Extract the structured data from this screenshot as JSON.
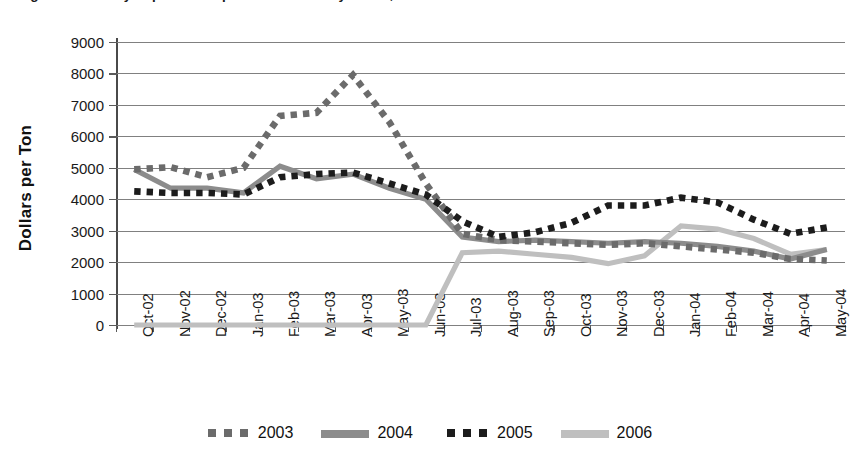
{
  "title": "Figure 4.   Monthly Paper and Paperboard Prices by Grade, 2002–2004",
  "axis": {
    "y_title": "Dollars per Ton",
    "y_ticks": [
      "9000",
      "8000",
      "7000",
      "6000",
      "5000",
      "4000",
      "3000",
      "2000",
      "1000",
      "0"
    ],
    "x_labels": [
      "Oct-02",
      "Nov-02",
      "Dec-02",
      "Jan-03",
      "Feb-03",
      "Mar-03",
      "Apr-03",
      "May-03",
      "Jun-03",
      "Jul-03",
      "Aug-03",
      "Sep-03",
      "Oct-03",
      "Nov-03",
      "Dec-03",
      "Jan-04",
      "Feb-04",
      "Mar-04",
      "Apr-04",
      "May-04"
    ]
  },
  "legend": {
    "items": [
      {
        "label": "2003",
        "color": "#6b6b6b",
        "style": "dotted"
      },
      {
        "label": "2004",
        "color": "#8c8c8c",
        "style": "solid"
      },
      {
        "label": "2005",
        "color": "#1c1c1c",
        "style": "dotted"
      },
      {
        "label": "2006",
        "color": "#bfbfbf",
        "style": "solid"
      }
    ]
  },
  "chart_data": {
    "type": "line",
    "title": "Monthly Paper and Paperboard Prices by Grade",
    "xlabel": "",
    "ylabel": "Dollars per Ton",
    "ylim": [
      0,
      9000
    ],
    "ytick_step": 1000,
    "grid": true,
    "legend_position": "bottom",
    "categories": [
      "Oct-02",
      "Nov-02",
      "Dec-02",
      "Jan-03",
      "Feb-03",
      "Mar-03",
      "Apr-03",
      "May-03",
      "Jun-03",
      "Jul-03",
      "Aug-03",
      "Sep-03",
      "Oct-03",
      "Nov-03",
      "Dec-03",
      "Jan-04",
      "Feb-04",
      "Mar-04",
      "Apr-04",
      "May-04"
    ],
    "series": [
      {
        "name": "2003",
        "color": "#6b6b6b",
        "style": "dotted",
        "values": [
          4950,
          5020,
          4700,
          5000,
          6650,
          6750,
          7950,
          6450,
          4500,
          2900,
          2700,
          2650,
          2600,
          2550,
          2600,
          2500,
          2400,
          2300,
          2100,
          2050
        ]
      },
      {
        "name": "2004",
        "color": "#8c8c8c",
        "style": "solid",
        "values": [
          4950,
          4350,
          4350,
          4200,
          5050,
          4650,
          4800,
          4350,
          4000,
          2800,
          2650,
          2700,
          2650,
          2600,
          2650,
          2600,
          2500,
          2350,
          2100,
          2400
        ]
      },
      {
        "name": "2005",
        "color": "#1c1c1c",
        "style": "dotted",
        "values": [
          4250,
          4200,
          4200,
          4150,
          4700,
          4800,
          4850,
          4500,
          4150,
          3300,
          2800,
          2950,
          3250,
          3800,
          3800,
          4050,
          3900,
          3350,
          2900,
          3100
        ]
      },
      {
        "name": "2006",
        "color": "#bfbfbf",
        "style": "solid",
        "values": [
          0,
          0,
          0,
          0,
          0,
          0,
          0,
          0,
          0,
          2300,
          2350,
          2250,
          2150,
          1950,
          2200,
          3150,
          3050,
          2750,
          2250,
          2400
        ]
      }
    ]
  }
}
